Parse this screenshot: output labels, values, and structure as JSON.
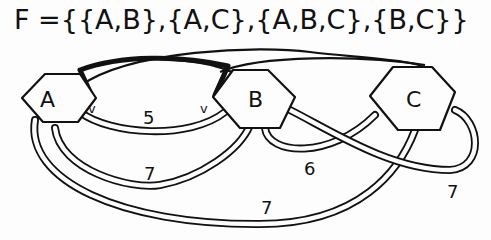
{
  "title": "F ={{A,B},{A,C},{A,B,C},{B,C}}",
  "nodes": [
    {
      "id": "A",
      "label": "A"
    },
    {
      "id": "B",
      "label": "B"
    },
    {
      "id": "C",
      "label": "C"
    }
  ],
  "hyperedges": [
    {
      "members": [
        "A",
        "B"
      ],
      "weight": "5"
    },
    {
      "members": [
        "A",
        "C"
      ],
      "weight": "7"
    },
    {
      "members": [
        "A",
        "B",
        "C"
      ],
      "weight": "7"
    },
    {
      "members": [
        "B",
        "C"
      ],
      "weight": "6"
    },
    {
      "members": [
        "B",
        "C"
      ],
      "weight": "7"
    }
  ],
  "labels": {
    "w_ab": "5",
    "w_a_low": "7",
    "w_bc": "6",
    "w_c_right": "7",
    "w_bottom": "7",
    "check_left": "v",
    "check_right": "v"
  }
}
